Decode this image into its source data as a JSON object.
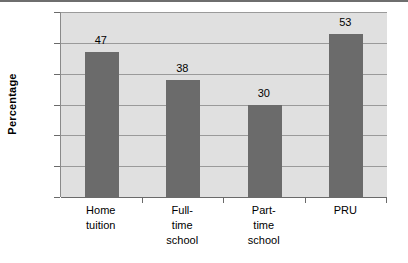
{
  "chart_data": {
    "type": "bar",
    "title": "",
    "subtitle": "",
    "xlabel": "",
    "ylabel": "Percentage",
    "categories": [
      "Home tuition",
      "Full-time school",
      "Part-time school",
      "PRU"
    ],
    "category_lines": [
      [
        "Home",
        "tuition"
      ],
      [
        "Full-",
        "time",
        "school"
      ],
      [
        "Part-",
        "time",
        "school"
      ],
      [
        "PRU"
      ]
    ],
    "values": [
      47,
      38,
      30,
      53
    ],
    "value_labels": [
      "47",
      "38",
      "30",
      "53"
    ],
    "ylim": [
      0,
      60
    ],
    "ytick_step": 10,
    "yticks": [
      0,
      10,
      20,
      30,
      40,
      50,
      60
    ],
    "ytick_labels": [
      "0",
      "10",
      "20",
      "30",
      "40",
      "50",
      "60"
    ],
    "grid": true,
    "grid_axis": "y",
    "legend": false,
    "legend_position": "none",
    "bar_color": "#6b6b6b",
    "plot_background": "#e0e0e0",
    "gridline_color": "#9a9a9a",
    "axis_color": "#6a6a6a",
    "page_background": "#ffffff"
  }
}
